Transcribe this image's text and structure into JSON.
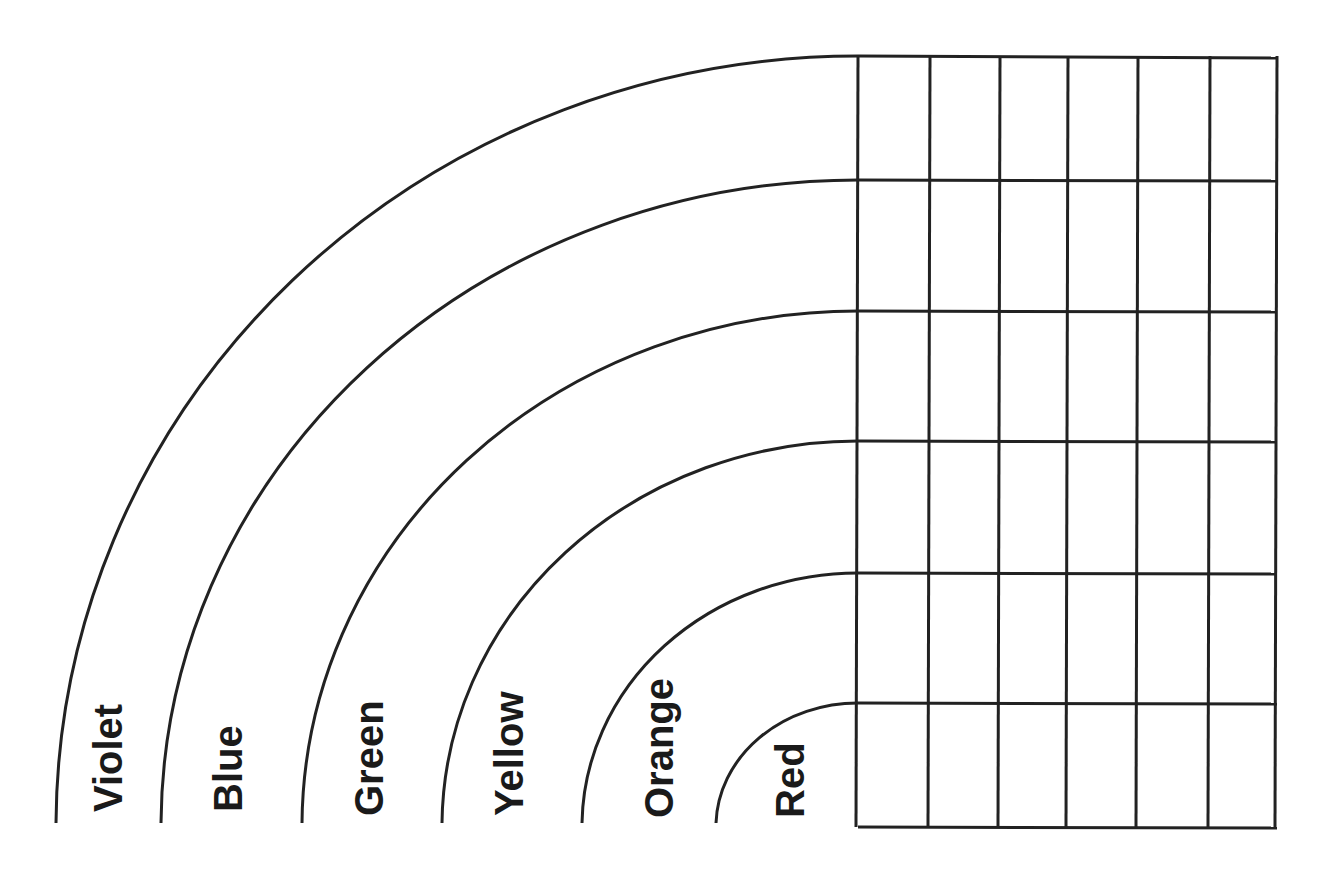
{
  "diagram": {
    "type": "rainbow-bar-graph-worksheet",
    "stroke_color": "#222222",
    "background": "#ffffff",
    "bands": [
      {
        "label": "Violet",
        "radius": 800
      },
      {
        "label": "Blue",
        "radius": 697
      },
      {
        "label": "Green",
        "radius": 557
      },
      {
        "label": "Yellow",
        "radius": 417
      },
      {
        "label": "Orange",
        "radius": 277
      },
      {
        "label": "Red",
        "radius": 140
      }
    ],
    "grid": {
      "rows": 6,
      "columns": 6,
      "left": 858,
      "right": 1277,
      "row_lines_y": [
        56,
        180,
        311,
        441,
        573,
        703,
        827
      ],
      "column_lines_x": [
        858,
        930,
        1000,
        1068,
        1138,
        1210,
        1277
      ]
    }
  }
}
